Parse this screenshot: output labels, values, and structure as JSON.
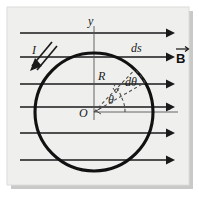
{
  "figure": {
    "background_color": "#efefed",
    "frame_color": "#d8d8d6",
    "shadow_color": "#c9c9c7",
    "ink_color": "#1a1a1a",
    "dash_color": "#4a4a4a",
    "labels": {
      "y_axis": "y",
      "x_axis": "x",
      "origin": "O",
      "radius": "R",
      "angle": "θ",
      "delta_angle": "dθ",
      "arc_element": "ds",
      "current": "I",
      "field": "B"
    },
    "geometry": {
      "center_x": 94,
      "center_y": 112,
      "radius": 59,
      "theta_deg": 30,
      "dtheta_deg": 22,
      "field_line_count": 6,
      "field_line_y": [
        33,
        57,
        84,
        107,
        133,
        160
      ],
      "field_line_x_start": 20,
      "field_line_x_end": 172
    }
  }
}
